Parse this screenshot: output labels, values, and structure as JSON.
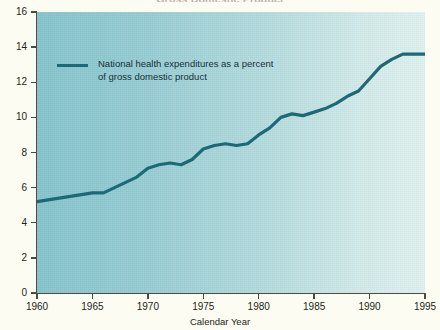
{
  "figure": {
    "title_clipped": "Gross Domestic Product",
    "xaxis_title": "Calendar Year"
  },
  "legend": {
    "swatch_color": "#1d6a77",
    "label": "National health expenditures as a percent\nof gross domestic product"
  },
  "colors": {
    "line": "#1d6a77",
    "plot_gradient_start": "#83c3cc",
    "plot_gradient_end": "#dff1ef",
    "axis": "#4e4a42",
    "page_background": "#fdfcf2",
    "text": "#231f20"
  },
  "axes": {
    "y_ticks": [
      "0",
      "2",
      "4",
      "6",
      "8",
      "10",
      "12",
      "14",
      "16"
    ],
    "x_ticks": [
      "1960",
      "1965",
      "1970",
      "1975",
      "1980",
      "1985",
      "1990",
      "1995"
    ]
  },
  "chart_data": {
    "type": "line",
    "title": "Gross Domestic Product",
    "xlabel": "Calendar Year",
    "ylabel": "",
    "xlim": [
      1960,
      1995
    ],
    "ylim": [
      0,
      16
    ],
    "grid": false,
    "legend_position": "inside-top-left",
    "x": [
      1960,
      1961,
      1962,
      1963,
      1964,
      1965,
      1966,
      1967,
      1968,
      1969,
      1970,
      1971,
      1972,
      1973,
      1974,
      1975,
      1976,
      1977,
      1978,
      1979,
      1980,
      1981,
      1982,
      1983,
      1984,
      1985,
      1986,
      1987,
      1988,
      1989,
      1990,
      1991,
      1992,
      1993,
      1994,
      1995
    ],
    "series": [
      {
        "name": "National health expenditures as a percent of gross domestic product",
        "values": [
          5.2,
          5.3,
          5.4,
          5.5,
          5.6,
          5.7,
          5.7,
          6.0,
          6.3,
          6.6,
          7.1,
          7.3,
          7.4,
          7.3,
          7.6,
          8.2,
          8.4,
          8.5,
          8.4,
          8.5,
          9.0,
          9.4,
          10.0,
          10.2,
          10.1,
          10.3,
          10.5,
          10.8,
          11.2,
          11.5,
          12.2,
          12.9,
          13.3,
          13.6,
          13.6,
          13.6
        ],
        "color": "#1d6a77"
      }
    ]
  }
}
